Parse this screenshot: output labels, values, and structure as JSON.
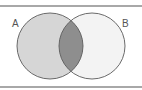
{
  "diagram": {
    "type": "venn",
    "sets": [
      {
        "id": "A",
        "label": "A",
        "cx": 50,
        "cy": 46,
        "r": 33,
        "fill": "#d6d6d6"
      },
      {
        "id": "B",
        "label": "B",
        "cx": 92,
        "cy": 46,
        "r": 33,
        "fill": "#f3f3f3"
      }
    ],
    "intersection": {
      "sets": [
        "A",
        "B"
      ],
      "fill": "#8e8e8e",
      "highlighted": true
    },
    "stroke": "#5a5a5a",
    "rule_color": "#a8a8a8"
  }
}
